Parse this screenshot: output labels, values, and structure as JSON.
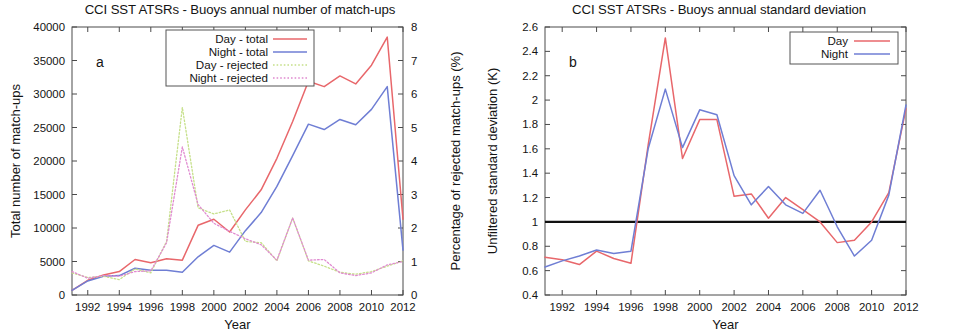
{
  "figure": {
    "panels": [
      {
        "letter": "a",
        "title": "CCI SST ATSRs - Buoys annual number of match-ups",
        "xlabel": "Year",
        "ylabel_left": "Total number of match-ups",
        "ylabel_right": "Percentage of rejected match-ups (%)"
      },
      {
        "letter": "b",
        "title": "CCI SST ATSRs - Buoys annual standard deviation",
        "xlabel": "Year",
        "ylabel_left": "Unfiltered standard deviation (K)"
      }
    ]
  },
  "colors": {
    "day": "#e8676b",
    "night": "#6f7ed4",
    "day_rejected": "#c6e08a",
    "night_rejected": "#e08ad0",
    "reference_line": "#111111",
    "axis": "#4a4a4a",
    "text": "#141414"
  },
  "chart_data": [
    {
      "type": "line",
      "title": "CCI SST ATSRs - Buoys annual number of match-ups",
      "panel_letter": "a",
      "xlabel": "Year",
      "ylabel": "Total number of match-ups",
      "y2label": "Percentage of rejected match-ups (%)",
      "xlim": [
        1991,
        2012
      ],
      "ylim": [
        0,
        40000
      ],
      "y2lim": [
        0,
        8
      ],
      "xticks": [
        1992,
        1994,
        1996,
        1998,
        2000,
        2002,
        2004,
        2006,
        2008,
        2010,
        2012
      ],
      "yticks": [
        0,
        5000,
        10000,
        15000,
        20000,
        25000,
        30000,
        35000,
        40000
      ],
      "y2ticks": [
        0,
        1,
        2,
        3,
        4,
        5,
        6,
        7,
        8
      ],
      "grid": false,
      "legend_position": "top-center",
      "x": [
        1991,
        1992,
        1993,
        1994,
        1995,
        1996,
        1997,
        1998,
        1999,
        2000,
        2001,
        2002,
        2003,
        2004,
        2005,
        2006,
        2007,
        2008,
        2009,
        2010,
        2011,
        2012
      ],
      "series": [
        {
          "name": "Day - total",
          "color": "#e8676b",
          "style": "solid",
          "axis": "left",
          "values": [
            700,
            2200,
            3000,
            3500,
            5300,
            4800,
            5400,
            5200,
            10400,
            11300,
            9400,
            12700,
            15700,
            20400,
            25900,
            31900,
            31100,
            32700,
            31500,
            34300,
            38500,
            11300
          ]
        },
        {
          "name": "Night - total",
          "color": "#6f7ed4",
          "style": "solid",
          "axis": "left",
          "values": [
            700,
            2100,
            2800,
            2900,
            4000,
            3700,
            3700,
            3400,
            5700,
            7400,
            6400,
            9600,
            12300,
            16200,
            20800,
            25500,
            24700,
            26200,
            25400,
            27700,
            31100,
            6700
          ]
        },
        {
          "name": "Day - rejected",
          "color": "#c6e08a",
          "style": "dotted",
          "axis": "right",
          "values": [
            0.66,
            0.52,
            0.56,
            0.46,
            0.78,
            0.66,
            1.6,
            5.6,
            2.6,
            2.42,
            2.54,
            1.6,
            1.56,
            1.02,
            2.3,
            1.02,
            0.86,
            0.68,
            0.62,
            0.7,
            0.86,
            1.02
          ]
        },
        {
          "name": "Night - rejected",
          "color": "#e08ad0",
          "style": "dotted",
          "axis": "right",
          "values": [
            0.7,
            0.5,
            0.58,
            0.56,
            0.7,
            0.72,
            1.56,
            4.42,
            2.7,
            2.14,
            1.9,
            1.68,
            1.5,
            1.04,
            2.3,
            1.04,
            1.06,
            0.66,
            0.58,
            0.66,
            0.9,
            1.0
          ]
        }
      ]
    },
    {
      "type": "line",
      "title": "CCI SST ATSRs - Buoys annual standard deviation",
      "panel_letter": "b",
      "xlabel": "Year",
      "ylabel": "Unfiltered standard deviation (K)",
      "xlim": [
        1991,
        2012
      ],
      "ylim": [
        0.4,
        2.6
      ],
      "xticks": [
        1992,
        1994,
        1996,
        1998,
        2000,
        2002,
        2004,
        2006,
        2008,
        2010,
        2012
      ],
      "yticks": [
        0.4,
        0.6,
        0.8,
        1.0,
        1.2,
        1.4,
        1.6,
        1.8,
        2.0,
        2.2,
        2.4,
        2.6
      ],
      "grid": false,
      "legend_position": "top-right",
      "reference_line_y": 1.0,
      "x": [
        1991,
        1992,
        1993,
        1994,
        1995,
        1996,
        1997,
        1998,
        1999,
        2000,
        2001,
        2002,
        2003,
        2004,
        2005,
        2006,
        2007,
        2008,
        2009,
        2010,
        2011,
        2012
      ],
      "series": [
        {
          "name": "Day",
          "color": "#e8676b",
          "style": "solid",
          "values": [
            0.71,
            0.69,
            0.65,
            0.76,
            0.7,
            0.66,
            1.63,
            2.51,
            1.52,
            1.84,
            1.84,
            1.21,
            1.23,
            1.03,
            1.2,
            1.1,
            1.0,
            0.83,
            0.85,
            1.0,
            1.24,
            1.93
          ]
        },
        {
          "name": "Night",
          "color": "#6f7ed4",
          "style": "solid",
          "values": [
            0.63,
            0.68,
            0.72,
            0.77,
            0.74,
            0.76,
            1.6,
            2.09,
            1.61,
            1.92,
            1.88,
            1.38,
            1.14,
            1.29,
            1.14,
            1.07,
            1.26,
            0.96,
            0.72,
            0.85,
            1.22,
            1.96
          ]
        }
      ]
    }
  ],
  "legends": {
    "panel_a": [
      {
        "label": "Day - total",
        "color": "#e8676b",
        "style": "solid"
      },
      {
        "label": "Night - total",
        "color": "#6f7ed4",
        "style": "solid"
      },
      {
        "label": "Day - rejected",
        "color": "#c6e08a",
        "style": "dotted"
      },
      {
        "label": "Night - rejected",
        "color": "#e08ad0",
        "style": "dotted"
      }
    ],
    "panel_b": [
      {
        "label": "Day",
        "color": "#e8676b",
        "style": "solid"
      },
      {
        "label": "Night",
        "color": "#6f7ed4",
        "style": "solid"
      }
    ]
  }
}
